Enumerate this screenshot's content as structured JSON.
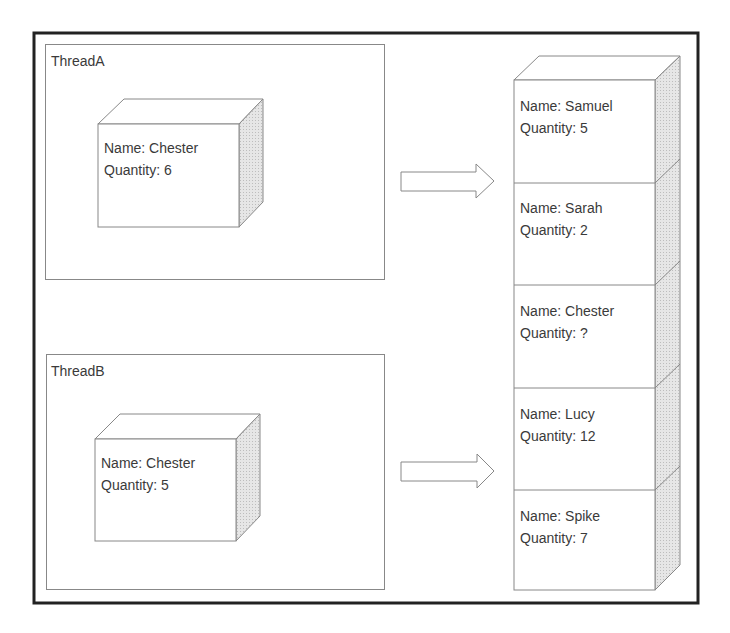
{
  "threads": [
    {
      "title": "ThreadA",
      "record": {
        "name_label": "Name: Chester",
        "quantity_label": "Quantity: 6"
      }
    },
    {
      "title": "ThreadB",
      "record": {
        "name_label": "Name: Chester",
        "quantity_label": "Quantity: 5"
      }
    }
  ],
  "stack": [
    {
      "name_label": "Name: Samuel",
      "quantity_label": "Quantity: 5"
    },
    {
      "name_label": "Name: Sarah",
      "quantity_label": "Quantity: 2"
    },
    {
      "name_label": "Name: Chester",
      "quantity_label": "Quantity: ?"
    },
    {
      "name_label": "Name: Lucy",
      "quantity_label": "Quantity: 12"
    },
    {
      "name_label": "Name: Spike",
      "quantity_label": "Quantity: 7"
    }
  ],
  "colors": {
    "stroke": "#7a7a7a",
    "frame": "#222222",
    "side_fill": "#dcdcdc",
    "text": "#3a3a3a"
  }
}
